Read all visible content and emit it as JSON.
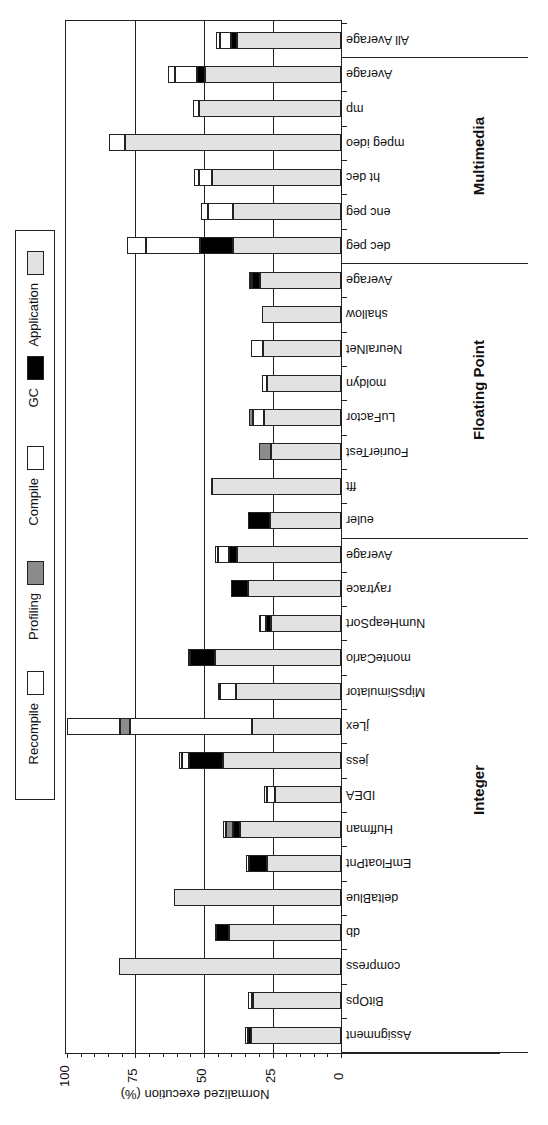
{
  "chart_data": {
    "type": "bar",
    "orientation": "horizontal-stacked",
    "rotation_deg": 180,
    "title": "",
    "xlabel": "Normalized execution (%)",
    "ylabel": "",
    "xlim": [
      0,
      100
    ],
    "ticks": [
      "0",
      "25",
      "50",
      "75",
      "100"
    ],
    "grid": true,
    "legend_position": "left-strip",
    "series_order": [
      "Application",
      "GC",
      "Compile",
      "Profiling",
      "Recompile"
    ],
    "legend": [
      {
        "key": "recompile",
        "label": "Recompile",
        "color": "#ffffff"
      },
      {
        "key": "profiling",
        "label": "Profiling",
        "color": "#8c8c8c"
      },
      {
        "key": "compile",
        "label": "Compile",
        "color": "#ffffff"
      },
      {
        "key": "gc",
        "label": "GC",
        "color": "#000000"
      },
      {
        "key": "application",
        "label": "Application",
        "color": "#e2e2e2"
      }
    ],
    "groups": [
      {
        "name": "Integer",
        "categories": [
          "Assignment",
          "BitOps",
          "compress",
          "db",
          "deltaBlue",
          "EmFloatPnt",
          "Huffman",
          "IDEA",
          "jess",
          "jLex",
          "MipsSimulator",
          "monteCarlo",
          "NumHeapSort",
          "raytrace",
          "Average"
        ]
      },
      {
        "name": "Floating Point",
        "categories": [
          "euler",
          "fft",
          "FourierTest",
          "LuFactor",
          "moldyn",
          "NeuralNet",
          "shallow",
          "Average"
        ]
      },
      {
        "name": "Multimedia",
        "categories": [
          "dec peg",
          "enc peg",
          "ht dec",
          "mpeg ideo",
          "mp",
          "Average"
        ]
      },
      {
        "name": "",
        "categories": [
          "All Average"
        ]
      }
    ],
    "rows": [
      {
        "label": "Assignment",
        "application": 33,
        "gc": 1,
        "compile": 1,
        "profiling": 0,
        "recompile": 0,
        "total": 35
      },
      {
        "label": "BitOps",
        "application": 32,
        "gc": 0.5,
        "compile": 1.5,
        "profiling": 0,
        "recompile": 0,
        "total": 34
      },
      {
        "label": "compress",
        "application": 81,
        "gc": 0,
        "compile": 0,
        "profiling": 0,
        "recompile": 0,
        "total": 81
      },
      {
        "label": "db",
        "application": 41,
        "gc": 4.5,
        "compile": 0.5,
        "profiling": 0,
        "recompile": 0,
        "total": 46
      },
      {
        "label": "deltaBlue",
        "application": 61,
        "gc": 0,
        "compile": 0,
        "profiling": 0,
        "recompile": 0,
        "total": 61
      },
      {
        "label": "EmFloatPnt",
        "application": 27,
        "gc": 6.5,
        "compile": 1,
        "profiling": 0,
        "recompile": 0,
        "total": 34.5
      },
      {
        "label": "Huffman",
        "application": 37,
        "gc": 2.5,
        "compile": 0,
        "profiling": 2.5,
        "recompile": 1,
        "total": 43
      },
      {
        "label": "IDEA",
        "application": 24,
        "gc": 0,
        "compile": 3,
        "profiling": 0,
        "recompile": 1,
        "total": 28
      },
      {
        "label": "jess",
        "application": 43,
        "gc": 12.5,
        "compile": 2.5,
        "profiling": 0,
        "recompile": 1,
        "total": 59
      },
      {
        "label": "jLex",
        "application": 32.5,
        "gc": 0,
        "compile": 44.5,
        "profiling": 3.5,
        "recompile": 19.5,
        "total": 100
      },
      {
        "label": "MipsSimulator",
        "application": 38.5,
        "gc": 0,
        "compile": 5.5,
        "profiling": 0,
        "recompile": 1,
        "total": 45
      },
      {
        "label": "monteCarlo",
        "application": 46,
        "gc": 9,
        "compile": 0,
        "profiling": 0,
        "recompile": 1,
        "total": 56
      },
      {
        "label": "NumHeapSort",
        "application": 25.5,
        "gc": 2,
        "compile": 2,
        "profiling": 0,
        "recompile": 0.5,
        "total": 30
      },
      {
        "label": "raytrace",
        "application": 34,
        "gc": 6,
        "compile": 0,
        "profiling": 0,
        "recompile": 0,
        "total": 40
      },
      {
        "label": "Average",
        "application": 38,
        "gc": 3,
        "compile": 4,
        "profiling": 0,
        "recompile": 1,
        "total": 46
      },
      {
        "label": "euler",
        "application": 26,
        "gc": 8,
        "compile": 0,
        "profiling": 0,
        "recompile": 0,
        "total": 34
      },
      {
        "label": "fft",
        "application": 47,
        "gc": 0,
        "compile": 0,
        "profiling": 0,
        "recompile": 0.5,
        "total": 47.5
      },
      {
        "label": "FourierTest",
        "application": 25.5,
        "gc": 0,
        "compile": 0,
        "profiling": 4.5,
        "recompile": 0,
        "total": 30
      },
      {
        "label": "LuFactor",
        "application": 28,
        "gc": 0,
        "compile": 4,
        "profiling": 1.5,
        "recompile": 0,
        "total": 33.5
      },
      {
        "label": "moldyn",
        "application": 27,
        "gc": 0,
        "compile": 2,
        "profiling": 0,
        "recompile": 0,
        "total": 29
      },
      {
        "label": "NeuralNet",
        "application": 28.5,
        "gc": 0,
        "compile": 4.5,
        "profiling": 0,
        "recompile": 0,
        "total": 33
      },
      {
        "label": "shallow",
        "application": 29,
        "gc": 0,
        "compile": 0,
        "profiling": 0,
        "recompile": 0,
        "total": 29
      },
      {
        "label": "Average",
        "application": 29.5,
        "gc": 3,
        "compile": 0.5,
        "profiling": 0,
        "recompile": 0.5,
        "total": 33.5
      },
      {
        "label": "dec peg",
        "application": 39.5,
        "gc": 12,
        "compile": 19.5,
        "profiling": 0,
        "recompile": 7,
        "total": 78
      },
      {
        "label": "enc peg",
        "application": 39.5,
        "gc": 0,
        "compile": 9,
        "profiling": 0,
        "recompile": 2.5,
        "total": 51
      },
      {
        "label": "ht dec",
        "application": 47,
        "gc": 0,
        "compile": 5,
        "profiling": 0,
        "recompile": 1.5,
        "total": 53.5
      },
      {
        "label": "mpeg ideo",
        "application": 79,
        "gc": 0,
        "compile": 0,
        "profiling": 0,
        "recompile": 5.5,
        "total": 84.5
      },
      {
        "label": "mp",
        "application": 52,
        "gc": 0,
        "compile": 0,
        "profiling": 0,
        "recompile": 2,
        "total": 54
      },
      {
        "label": "Average",
        "application": 49.5,
        "gc": 3,
        "compile": 8,
        "profiling": 0,
        "recompile": 2.5,
        "total": 63
      },
      {
        "label": "All Average",
        "application": 38,
        "gc": 2,
        "compile": 4,
        "profiling": 0,
        "recompile": 1.5,
        "total": 45.5
      }
    ]
  }
}
